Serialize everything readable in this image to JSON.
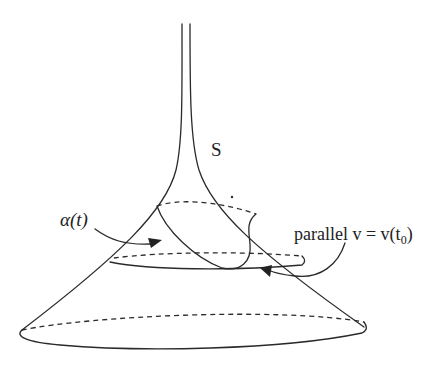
{
  "figure": {
    "labels": {
      "surface": "S",
      "curve": "α(t)",
      "parallel": "parallel v = v(t",
      "parallel_subscript": "0",
      "parallel_close": ")"
    },
    "colors": {
      "line": "#2a2a2a",
      "text": "#222222",
      "background": "#ffffff"
    }
  }
}
